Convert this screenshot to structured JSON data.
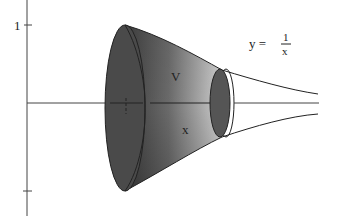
{
  "figure": {
    "axes": {
      "y_tick_label": "1",
      "x_tick_label": "1"
    },
    "labels": {
      "volume": "V",
      "x_var": "x",
      "equation_lhs": "y =",
      "equation_num": "1",
      "equation_den": "x"
    },
    "colors": {
      "background": "#ffffff",
      "dark_face": "#4a4a4a",
      "mid_shade": "#6e6e6e",
      "light_shade": "#c8c8c8",
      "line": "#222222"
    }
  }
}
